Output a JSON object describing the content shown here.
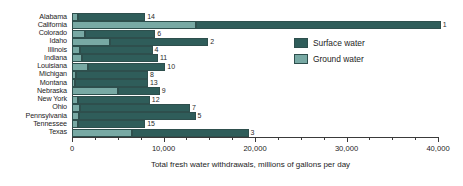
{
  "chart_data": {
    "type": "bar",
    "orientation": "horizontal",
    "stacked": true,
    "title": "",
    "xlabel": "Total fresh water withdrawals, millions of gallons per day",
    "ylabel": "",
    "xlim": [
      0,
      40000
    ],
    "xticks": [
      0,
      10000,
      20000,
      30000,
      40000
    ],
    "xtick_labels": [
      "0",
      "10,000",
      "20,000",
      "30,000",
      "40,000"
    ],
    "minor_tick_interval": 2500,
    "grid": false,
    "legend_position": "center-right",
    "categories": [
      "Alabama",
      "California",
      "Colorado",
      "Idaho",
      "Illinois",
      "Indiana",
      "Louisiana",
      "Michigan",
      "Montana",
      "Nebraska",
      "New York",
      "Ohio",
      "Pennsylvania",
      "Tennessee",
      "Texas"
    ],
    "series": [
      {
        "name": "Ground water",
        "color": "#78a9a4",
        "values": [
          700,
          13600,
          1400,
          4200,
          900,
          1100,
          1800,
          450,
          300,
          5000,
          700,
          900,
          800,
          700,
          6600
        ]
      },
      {
        "name": "Surface water",
        "color": "#2f5d5a",
        "values": [
          7300,
          26700,
          7700,
          10700,
          7900,
          8300,
          8400,
          7850,
          8000,
          4600,
          7800,
          12000,
          12700,
          7300,
          12700
        ]
      }
    ],
    "totals": [
      8000,
      40300,
      9100,
      14900,
      8800,
      9400,
      10200,
      8300,
      8300,
      9600,
      8500,
      12900,
      13500,
      8000,
      19300
    ],
    "point_labels": [
      "14",
      "1",
      "6",
      "2",
      "4",
      "11",
      "10",
      "8",
      "13",
      "9",
      "12",
      "7",
      "5",
      "15",
      "3"
    ],
    "point_label_meaning": "national rank by total fresh water withdrawals"
  },
  "legend": {
    "items": [
      {
        "label": "Surface water",
        "color": "#2f5d5a",
        "swatch": "surface"
      },
      {
        "label": "Ground water",
        "color": "#78a9a4",
        "swatch": "ground"
      }
    ]
  },
  "axis": {
    "title": "Total fresh water withdrawals, millions of gallons per day",
    "tick_labels": [
      "0",
      "10,000",
      "20,000",
      "30,000",
      "40,000"
    ]
  },
  "categories": [
    "Alabama",
    "California",
    "Colorado",
    "Idaho",
    "Illinois",
    "Indiana",
    "Louisiana",
    "Michigan",
    "Montana",
    "Nebraska",
    "New York",
    "Ohio",
    "Pennsylvania",
    "Tennessee",
    "Texas"
  ]
}
